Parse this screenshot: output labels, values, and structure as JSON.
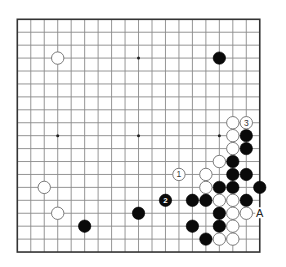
{
  "board": {
    "size": 19,
    "origin_x": 17.3,
    "origin_y": 19.3,
    "spacing_x": 13.47,
    "spacing_y": 12.93,
    "stone_radius": 6.2,
    "colors": {
      "grid": "#8a8a8a",
      "border": "#333333",
      "black_stone": "#0a0a0a",
      "white_stone": "#ffffff",
      "white_outline": "#6e6e6e"
    }
  },
  "star_points": [
    [
      3,
      3
    ],
    [
      9,
      3
    ],
    [
      15,
      3
    ],
    [
      3,
      9
    ],
    [
      9,
      9
    ],
    [
      15,
      9
    ],
    [
      3,
      15
    ],
    [
      9,
      15
    ],
    [
      15,
      15
    ]
  ],
  "stones": {
    "black": [
      {
        "col": 15,
        "row": 3
      },
      {
        "col": 17,
        "row": 9
      },
      {
        "col": 17,
        "row": 10
      },
      {
        "col": 16,
        "row": 11
      },
      {
        "col": 16,
        "row": 12
      },
      {
        "col": 17,
        "row": 12
      },
      {
        "col": 15,
        "row": 13
      },
      {
        "col": 16,
        "row": 13
      },
      {
        "col": 18,
        "row": 13
      },
      {
        "col": 11,
        "row": 14,
        "label": "2"
      },
      {
        "col": 13,
        "row": 14
      },
      {
        "col": 14,
        "row": 14
      },
      {
        "col": 17,
        "row": 14
      },
      {
        "col": 9,
        "row": 15
      },
      {
        "col": 15,
        "row": 15
      },
      {
        "col": 5,
        "row": 16
      },
      {
        "col": 13,
        "row": 16
      },
      {
        "col": 15,
        "row": 16
      },
      {
        "col": 14,
        "row": 17
      }
    ],
    "white": [
      {
        "col": 3,
        "row": 3
      },
      {
        "col": 16,
        "row": 8
      },
      {
        "col": 17,
        "row": 8,
        "label": "3"
      },
      {
        "col": 16,
        "row": 9
      },
      {
        "col": 16,
        "row": 10
      },
      {
        "col": 15,
        "row": 11
      },
      {
        "col": 12,
        "row": 12,
        "label": "1"
      },
      {
        "col": 14,
        "row": 12
      },
      {
        "col": 2,
        "row": 13
      },
      {
        "col": 14,
        "row": 13
      },
      {
        "col": 15,
        "row": 14
      },
      {
        "col": 16,
        "row": 14
      },
      {
        "col": 3,
        "row": 15
      },
      {
        "col": 16,
        "row": 15
      },
      {
        "col": 17,
        "row": 15
      },
      {
        "col": 16,
        "row": 16
      },
      {
        "col": 15,
        "row": 17
      },
      {
        "col": 16,
        "row": 17
      }
    ]
  },
  "markers": [
    {
      "col": 18,
      "row": 15,
      "text": "A"
    }
  ]
}
